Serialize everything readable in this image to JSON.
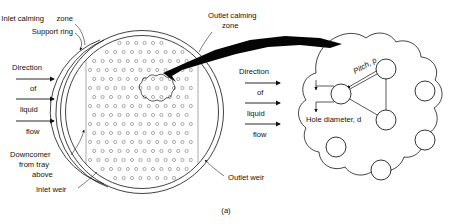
{
  "figure": {
    "caption": "(a)",
    "kind": "sieve-tray-schematic"
  },
  "labels": {
    "inlet_calming_zone": "Inlet calming",
    "inlet_calming_zone_2": "zone",
    "support_ring": "Support ring",
    "outlet_calming_zone": "Outlet calming",
    "outlet_calming_zone_2": "zone",
    "downcomer_1": "Downcomer",
    "downcomer_2": "from tray",
    "downcomer_3": "above",
    "inlet_weir": "Inlet weir",
    "outlet_weir": "Outlet weir",
    "pitch": "Pitch, p",
    "hole_diameter": "Hole diameter, d"
  },
  "flow_left": {
    "line1": "Direction",
    "line2": "of",
    "line3": "liquid",
    "line4": "flow"
  },
  "flow_right": {
    "line1": "Direction",
    "line2": "of",
    "line3": "liquid",
    "line4": "flow"
  },
  "colors": {
    "ink": "#111111",
    "hole_stroke": "#6b6b6b",
    "pointer_fill": "#050505",
    "background": "#ffffff"
  },
  "chart_data": {
    "type": "diagram",
    "tray": {
      "center_x": 142,
      "center_y": 112,
      "outer_radius": 82,
      "support_ring_radius": 77,
      "perforated_left_x": 88,
      "perforated_right_x": 196,
      "hole_rows": 18,
      "hole_cols": 13,
      "hole_radius": 1.6,
      "pitch_x": 8.4,
      "pitch_y": 9.0
    },
    "detail": {
      "center_x": 368,
      "center_y": 110,
      "blob_radius": 62,
      "holes": [
        {
          "cx": 341,
          "cy": 94,
          "r": 10
        },
        {
          "cx": 386,
          "cy": 69,
          "r": 10
        },
        {
          "cx": 386,
          "cy": 120,
          "r": 10
        },
        {
          "cx": 425,
          "cy": 91,
          "r": 10
        },
        {
          "cx": 425,
          "cy": 140,
          "r": 10
        },
        {
          "cx": 336,
          "cy": 147,
          "r": 10
        },
        {
          "cx": 381,
          "cy": 170,
          "r": 10
        }
      ],
      "triangle_vertices": [
        [
          341,
          94
        ],
        [
          386,
          69
        ],
        [
          386,
          120
        ]
      ]
    }
  }
}
